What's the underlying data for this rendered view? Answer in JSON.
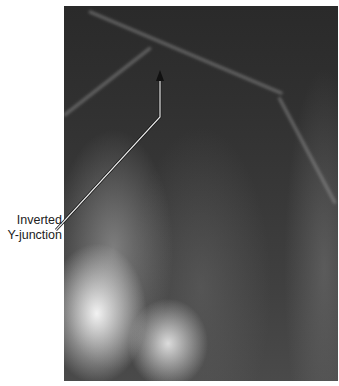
{
  "figure": {
    "type": "dental radiograph",
    "annotation": {
      "line1": "Inverted",
      "line2": "Y-junction"
    },
    "colors": {
      "leader_line": "#e8e8e8",
      "label_text": "#222222",
      "background": "#ffffff"
    }
  }
}
